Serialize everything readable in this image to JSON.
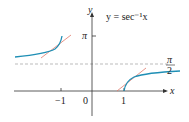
{
  "title": "y = sec⁻¹x",
  "axes": {
    "x_label": "x",
    "y_label": "y"
  },
  "ticks": {
    "x": [
      "−1",
      "0",
      "1"
    ],
    "y_pi": "π",
    "pi_over_2_num": "π",
    "pi_over_2_den": "2"
  },
  "colors": {
    "curve": "#1f8fb5",
    "tangent": "#e0786a",
    "axis": "#333333",
    "dashed": "#aaaaaa"
  }
}
